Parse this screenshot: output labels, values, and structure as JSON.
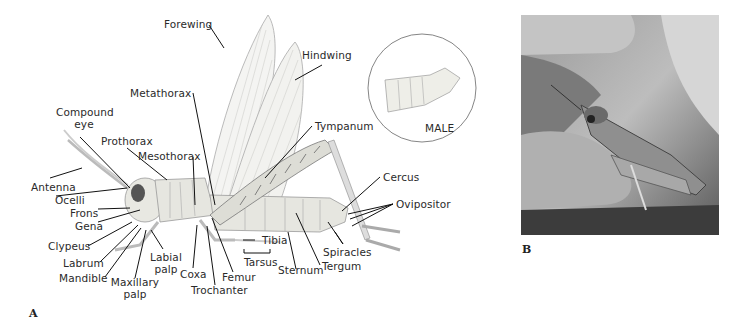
{
  "figure": {
    "panel_a_label": "A",
    "panel_b_label": "B",
    "inset_label": "MALE",
    "labels": {
      "forewing": "Forewing",
      "hindwing": "Hindwing",
      "metathorax": "Metathorax",
      "tympanum": "Tympanum",
      "compound_eye_1": "Compound",
      "compound_eye_2": "eye",
      "prothorax": "Prothorax",
      "mesothorax": "Mesothorax",
      "antenna": "Antenna",
      "ocelli": "Ocelli",
      "frons": "Frons",
      "gena": "Gena",
      "clypeus": "Clypeus",
      "labrum": "Labrum",
      "mandible": "Mandible",
      "maxillary_palp_1": "Maxillary",
      "maxillary_palp_2": "palp",
      "labial_palp_1": "Labial",
      "labial_palp_2": "palp",
      "coxa": "Coxa",
      "trochanter": "Trochanter",
      "femur": "Femur",
      "tibia": "Tibia",
      "tarsus": "Tarsus",
      "sternum": "Sternum",
      "spiracles": "Spiracles",
      "tergum": "Tergum",
      "cercus": "Cercus",
      "ovipositor": "Ovipositor"
    }
  },
  "colors": {
    "body": "#e6e6e0",
    "outline": "#8a8a84",
    "leader": "#111111",
    "wing": "#f4f4f2"
  }
}
